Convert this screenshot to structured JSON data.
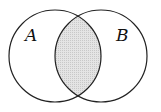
{
  "diagram": {
    "type": "venn",
    "sets": [
      {
        "label": "A",
        "cx": 55,
        "cy": 56,
        "r": 46
      },
      {
        "label": "B",
        "cx": 101,
        "cy": 56,
        "r": 46
      }
    ],
    "shaded_region": "A ∩ B",
    "colors": {
      "stroke": "#222222",
      "shade": "#d9d9d9",
      "background": "#ffffff"
    }
  }
}
